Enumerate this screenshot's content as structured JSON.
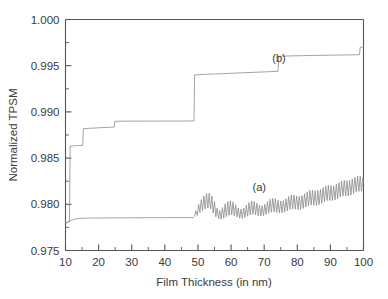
{
  "chart_data": {
    "type": "line",
    "title": "",
    "xlabel": "Film Thickness (in nm)",
    "ylabel": "Normalized TPSM",
    "xlim": [
      10,
      100
    ],
    "ylim": [
      0.975,
      1.0
    ],
    "grid": false,
    "legend_position": "inline-annotations",
    "xticks": [
      10,
      20,
      30,
      40,
      50,
      60,
      70,
      80,
      90,
      100
    ],
    "xticklabels": [
      "10",
      "20",
      "30",
      "40",
      "50",
      "60",
      "70",
      "80",
      "90",
      "100"
    ],
    "xminor_step": 5,
    "yticks": [
      0.975,
      0.98,
      0.985,
      0.99,
      0.995,
      1.0
    ],
    "yticklabels": [
      "0.975",
      "0.980",
      "0.985",
      "0.990",
      "0.995",
      "1.000"
    ],
    "yminor_step": 0.0025,
    "annotations": [
      {
        "text": "(a)",
        "x": 68.5,
        "y": 0.9814
      },
      {
        "text": "(b)",
        "x": 74.5,
        "y": 0.99545
      }
    ],
    "series": [
      {
        "name": "(a)",
        "label": "(a)",
        "color": "#8a8a8a",
        "description": "Flat baseline near 0.9785 up to 49 nm, then rapid oscillations of growing amplitude rising toward 0.983",
        "points": [
          [
            10.0,
            0.978
          ],
          [
            10.4,
            0.978
          ],
          [
            10.8,
            0.97812
          ],
          [
            11.2,
            0.9782
          ],
          [
            11.8,
            0.97826
          ],
          [
            12.6,
            0.97838
          ],
          [
            14.0,
            0.97846
          ],
          [
            16.0,
            0.9785
          ],
          [
            20.0,
            0.97852
          ],
          [
            25.0,
            0.97853
          ],
          [
            30.0,
            0.97854
          ],
          [
            35.0,
            0.97855
          ],
          [
            40.0,
            0.97855
          ],
          [
            45.0,
            0.97856
          ],
          [
            48.6,
            0.97856
          ],
          [
            49.0,
            0.9787
          ],
          [
            49.4,
            0.9793
          ],
          [
            49.8,
            0.9788
          ],
          [
            50.2,
            0.98
          ],
          [
            50.6,
            0.9791
          ],
          [
            51.0,
            0.9805
          ],
          [
            51.4,
            0.9793
          ],
          [
            51.8,
            0.9809
          ],
          [
            52.2,
            0.9795
          ],
          [
            52.6,
            0.98115
          ],
          [
            53.0,
            0.9796
          ],
          [
            53.4,
            0.9812
          ],
          [
            53.8,
            0.9795
          ],
          [
            54.2,
            0.9809
          ],
          [
            54.6,
            0.97905
          ],
          [
            55.0,
            0.9803
          ],
          [
            55.4,
            0.97865
          ],
          [
            55.8,
            0.9796
          ],
          [
            56.2,
            0.97845
          ],
          [
            56.6,
            0.97935
          ],
          [
            57.0,
            0.97838
          ],
          [
            57.4,
            0.97965
          ],
          [
            57.8,
            0.9785
          ],
          [
            58.2,
            0.98005
          ],
          [
            58.6,
            0.97866
          ],
          [
            59.0,
            0.9803
          ],
          [
            59.4,
            0.9788
          ],
          [
            59.8,
            0.9804
          ],
          [
            60.2,
            0.97885
          ],
          [
            60.6,
            0.98025
          ],
          [
            61.0,
            0.97875
          ],
          [
            61.4,
            0.97995
          ],
          [
            61.8,
            0.97862
          ],
          [
            62.2,
            0.9796
          ],
          [
            62.6,
            0.9785
          ],
          [
            63.0,
            0.97948
          ],
          [
            63.4,
            0.97848
          ],
          [
            63.8,
            0.9796
          ],
          [
            64.2,
            0.97858
          ],
          [
            64.6,
            0.9799
          ],
          [
            65.0,
            0.97872
          ],
          [
            65.4,
            0.9802
          ],
          [
            65.8,
            0.97886
          ],
          [
            66.2,
            0.98035
          ],
          [
            66.6,
            0.97892
          ],
          [
            67.0,
            0.9803
          ],
          [
            67.4,
            0.97886
          ],
          [
            67.8,
            0.9801
          ],
          [
            68.2,
            0.97876
          ],
          [
            68.6,
            0.9799
          ],
          [
            69.0,
            0.97872
          ],
          [
            69.4,
            0.97985
          ],
          [
            69.8,
            0.97878
          ],
          [
            70.2,
            0.98
          ],
          [
            70.6,
            0.9789
          ],
          [
            71.0,
            0.9803
          ],
          [
            71.4,
            0.97905
          ],
          [
            71.8,
            0.98055
          ],
          [
            72.2,
            0.97915
          ],
          [
            72.6,
            0.98065
          ],
          [
            73.0,
            0.97918
          ],
          [
            73.4,
            0.9806
          ],
          [
            73.8,
            0.97912
          ],
          [
            74.2,
            0.98045
          ],
          [
            74.6,
            0.97908
          ],
          [
            75.0,
            0.98035
          ],
          [
            75.4,
            0.97908
          ],
          [
            75.8,
            0.9804
          ],
          [
            76.2,
            0.97916
          ],
          [
            76.6,
            0.9806
          ],
          [
            77.0,
            0.9793
          ],
          [
            77.4,
            0.98085
          ],
          [
            77.8,
            0.97945
          ],
          [
            78.2,
            0.981
          ],
          [
            78.6,
            0.9795
          ],
          [
            79.0,
            0.981
          ],
          [
            79.4,
            0.97948
          ],
          [
            79.8,
            0.9809
          ],
          [
            80.2,
            0.97942
          ],
          [
            80.6,
            0.98085
          ],
          [
            81.0,
            0.97944
          ],
          [
            81.4,
            0.98095
          ],
          [
            81.8,
            0.97955
          ],
          [
            82.2,
            0.98115
          ],
          [
            82.6,
            0.9797
          ],
          [
            83.0,
            0.98135
          ],
          [
            83.4,
            0.97985
          ],
          [
            83.8,
            0.9815
          ],
          [
            84.2,
            0.97992
          ],
          [
            84.6,
            0.98152
          ],
          [
            85.0,
            0.9799
          ],
          [
            85.4,
            0.98148
          ],
          [
            85.8,
            0.97988
          ],
          [
            86.2,
            0.98148
          ],
          [
            86.6,
            0.97995
          ],
          [
            87.0,
            0.9816
          ],
          [
            87.4,
            0.9801
          ],
          [
            87.8,
            0.9818
          ],
          [
            88.2,
            0.98028
          ],
          [
            88.6,
            0.98198
          ],
          [
            89.0,
            0.9804
          ],
          [
            89.4,
            0.98205
          ],
          [
            89.8,
            0.98042
          ],
          [
            90.2,
            0.98202
          ],
          [
            90.6,
            0.9804
          ],
          [
            91.0,
            0.982
          ],
          [
            91.4,
            0.98048
          ],
          [
            91.8,
            0.98215
          ],
          [
            92.2,
            0.98062
          ],
          [
            92.6,
            0.98235
          ],
          [
            93.0,
            0.9808
          ],
          [
            93.4,
            0.98252
          ],
          [
            93.8,
            0.9809
          ],
          [
            94.2,
            0.98258
          ],
          [
            94.6,
            0.9809
          ],
          [
            95.0,
            0.98255
          ],
          [
            95.4,
            0.9809
          ],
          [
            95.8,
            0.98258
          ],
          [
            96.2,
            0.981
          ],
          [
            96.6,
            0.98272
          ],
          [
            97.0,
            0.98118
          ],
          [
            97.4,
            0.98292
          ],
          [
            97.8,
            0.98135
          ],
          [
            98.2,
            0.98305
          ],
          [
            98.6,
            0.9814
          ],
          [
            99.0,
            0.98305
          ],
          [
            99.4,
            0.98142
          ],
          [
            99.8,
            0.9829
          ],
          [
            100.0,
            0.9823
          ]
        ]
      },
      {
        "name": "(b)",
        "label": "(b)",
        "color": "#8a8a8a",
        "description": "Staircase curve with discrete upward jumps at approximately 11.5, 15.5, 25, 49, 74.5 and 99 nm",
        "steps": [
          {
            "x_start": 10.0,
            "x_end": 11.4,
            "y": 0.97805
          },
          {
            "x_start": 11.4,
            "x_end": 15.4,
            "y": 0.9863
          },
          {
            "x_start": 15.4,
            "x_end": 24.8,
            "y": 0.9882
          },
          {
            "x_start": 24.8,
            "x_end": 48.9,
            "y": 0.989
          },
          {
            "x_start": 48.9,
            "x_end": 74.3,
            "y": 0.99405
          },
          {
            "x_start": 74.3,
            "x_end": 98.9,
            "y": 0.99605
          },
          {
            "x_start": 98.9,
            "x_end": 100.0,
            "y": 0.997
          }
        ],
        "points": [
          [
            10.0,
            0.978
          ],
          [
            11.2,
            0.9781
          ],
          [
            11.4,
            0.9863
          ],
          [
            12.0,
            0.98632
          ],
          [
            13.0,
            0.98634
          ],
          [
            14.0,
            0.98636
          ],
          [
            15.2,
            0.98638
          ],
          [
            15.4,
            0.98818
          ],
          [
            17.0,
            0.98822
          ],
          [
            20.0,
            0.98828
          ],
          [
            24.0,
            0.98835
          ],
          [
            24.7,
            0.98836
          ],
          [
            24.9,
            0.98898
          ],
          [
            28.0,
            0.989
          ],
          [
            34.0,
            0.989
          ],
          [
            40.0,
            0.98901
          ],
          [
            46.0,
            0.98901
          ],
          [
            48.8,
            0.98902
          ],
          [
            49.0,
            0.994
          ],
          [
            52.0,
            0.99406
          ],
          [
            56.0,
            0.99412
          ],
          [
            60.0,
            0.99418
          ],
          [
            64.0,
            0.99424
          ],
          [
            68.0,
            0.9943
          ],
          [
            72.0,
            0.99436
          ],
          [
            74.2,
            0.9944
          ],
          [
            74.4,
            0.99602
          ],
          [
            78.0,
            0.99606
          ],
          [
            82.0,
            0.99609
          ],
          [
            86.0,
            0.99612
          ],
          [
            90.0,
            0.99614
          ],
          [
            94.0,
            0.99616
          ],
          [
            98.0,
            0.99618
          ],
          [
            98.8,
            0.9962
          ],
          [
            99.0,
            0.997
          ],
          [
            100.0,
            0.99702
          ]
        ]
      }
    ]
  },
  "colors": {
    "axis": "#555555",
    "curve": "#8a8a8a",
    "text": "#3a3a3a",
    "background": "#ffffff"
  }
}
